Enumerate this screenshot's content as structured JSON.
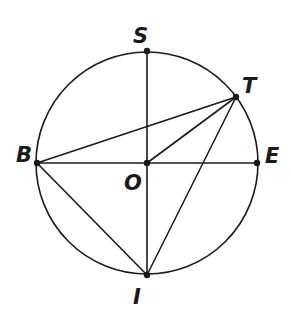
{
  "figure": {
    "type": "geometry-circle",
    "background": "#ffffff",
    "stroke_color": "#1a1a1a",
    "circle": {
      "center": "O",
      "cx": 147,
      "cy": 163,
      "r": 111
    },
    "points": [
      {
        "name": "S",
        "x": 147,
        "y": 51,
        "label_x": 133,
        "label_y": 43
      },
      {
        "name": "T",
        "x": 236,
        "y": 97,
        "label_x": 242,
        "label_y": 93
      },
      {
        "name": "B",
        "x": 37,
        "y": 163,
        "label_x": 16,
        "label_y": 162
      },
      {
        "name": "E",
        "x": 257,
        "y": 163,
        "label_x": 265,
        "label_y": 163
      },
      {
        "name": "O",
        "x": 147,
        "y": 163,
        "label_x": 124,
        "label_y": 190
      },
      {
        "name": "I",
        "x": 147,
        "y": 275,
        "label_x": 133,
        "label_y": 304
      }
    ],
    "segments": [
      [
        "S",
        "I"
      ],
      [
        "B",
        "E"
      ],
      [
        "B",
        "T"
      ],
      [
        "O",
        "T"
      ],
      [
        "T",
        "I"
      ],
      [
        "B",
        "I"
      ]
    ]
  }
}
